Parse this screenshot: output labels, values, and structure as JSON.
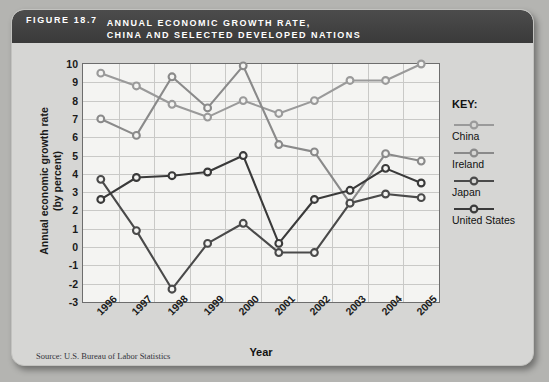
{
  "figure": {
    "number": "FIGURE  18.7",
    "title": "ANNUAL ECONOMIC GROWTH RATE,\nCHINA AND SELECTED DEVELOPED NATIONS",
    "source": "Source: U.S. Bureau of Labor Statistics"
  },
  "legend": {
    "title": "KEY:",
    "items": [
      {
        "label": "China",
        "color": "#9a9a9a"
      },
      {
        "label": "Ireland",
        "color": "#8a8a8a"
      },
      {
        "label": "Japan",
        "color": "#4a4a4a"
      },
      {
        "label": "United States",
        "color": "#3a3a3a"
      }
    ]
  },
  "chart_data": {
    "type": "line",
    "title": "Annual Economic Growth Rate, China and Selected Developed Nations",
    "xlabel": "Year",
    "ylabel": "Annual economic growth rate\n(by percent)",
    "categories": [
      "1996",
      "1997",
      "1998",
      "1999",
      "2000",
      "2001",
      "2002",
      "2003",
      "2004",
      "2005"
    ],
    "ylim": [
      -3,
      10
    ],
    "yticks": [
      10,
      9,
      8,
      7,
      6,
      5,
      4,
      3,
      2,
      1,
      0,
      -1,
      -2,
      -3
    ],
    "grid": true,
    "legend_position": "right",
    "series": [
      {
        "name": "China",
        "color": "#9a9a9a",
        "values": [
          9.5,
          8.8,
          7.8,
          7.1,
          8.0,
          7.3,
          8.0,
          9.1,
          9.1,
          10.0
        ]
      },
      {
        "name": "Ireland",
        "color": "#8a8a8a",
        "values": [
          7.0,
          6.1,
          9.3,
          7.6,
          9.9,
          5.6,
          5.2,
          2.4,
          5.1,
          4.7
        ]
      },
      {
        "name": "Japan",
        "color": "#4a4a4a",
        "values": [
          3.7,
          0.9,
          -2.3,
          0.2,
          1.3,
          -0.3,
          -0.3,
          2.4,
          2.9,
          2.7
        ]
      },
      {
        "name": "United States",
        "color": "#3a3a3a",
        "values": [
          2.6,
          3.8,
          3.9,
          4.1,
          5.0,
          0.2,
          2.6,
          3.1,
          4.3,
          3.5
        ]
      }
    ]
  }
}
